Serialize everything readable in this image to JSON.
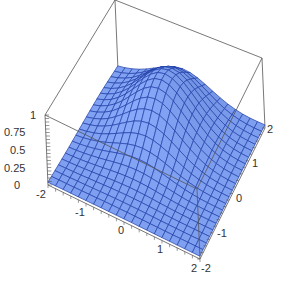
{
  "chart_data": {
    "type": "surface3d",
    "title": "",
    "xlabel": "",
    "ylabel": "",
    "zlabel": "",
    "x_range": [
      -2,
      2
    ],
    "y_range": [
      -2,
      2
    ],
    "z_range": [
      0,
      1
    ],
    "x_ticks": [
      "-2",
      "-1",
      "0",
      "1",
      "2"
    ],
    "y_ticks": [
      "-2",
      "-1",
      "0",
      "1",
      "2"
    ],
    "z_ticks": [
      "0",
      "0.25",
      "0.5",
      "0.75",
      "1"
    ],
    "mesh_lines_per_axis": 21,
    "surface_description": "smooth bump peaking near the back-center of the domain, falling to near 0 at the edges",
    "peak_z_approx": 0.7,
    "colors": {
      "surface_fill": "#7f9ff0",
      "mesh_line": "#1f3fa8",
      "box_edge": "#555555",
      "background": "#ffffff"
    },
    "box": true
  }
}
